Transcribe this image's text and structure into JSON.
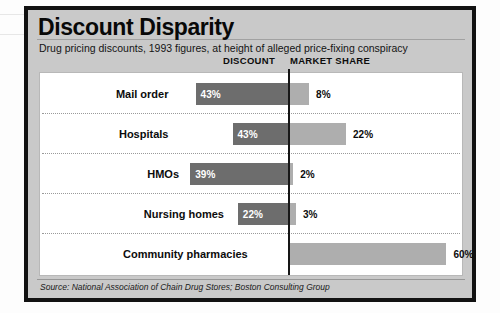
{
  "figure": {
    "title": "Discount Disparity",
    "subtitle": "Drug pricing discounts, 1993 figures, at height of alleged price-fixing conspiracy",
    "source": "Source: National Association of Chain Drug Stores; Boston Consulting Group",
    "column_headers": {
      "discount": "DISCOUNT",
      "market_share": "MARKET SHARE"
    },
    "colors": {
      "discount_bar": "#6d6d6d",
      "market_share_bar": "#aeaeae",
      "plate_background": "#c9c9c9",
      "panel_background": "#ffffff",
      "frame": "#121212",
      "axis": "#171717"
    }
  },
  "chart_data": {
    "type": "bar",
    "title": "Discount Disparity",
    "subtitle": "Drug pricing discounts, 1993 figures, at height of alleged price-fixing conspiracy",
    "orientation": "horizontal",
    "layout": "diverging-bidirectional",
    "categories": [
      "Mail order",
      "Hospitals",
      "HMOs",
      "Nursing homes",
      "Community pharmacies"
    ],
    "series": [
      {
        "name": "DISCOUNT",
        "direction": "left",
        "unit": "%",
        "values": [
          43,
          43,
          39,
          22,
          13
        ],
        "labels": [
          "43%",
          "43%",
          "39%",
          "22%",
          "13%"
        ]
      },
      {
        "name": "MARKET SHARE",
        "direction": "right",
        "unit": "%",
        "values": [
          8,
          22,
          2,
          3,
          60
        ],
        "labels": [
          "8%",
          "22%",
          "2%",
          "3%",
          "60%"
        ]
      }
    ],
    "rows": [
      {
        "category": "Mail order",
        "discount": 43,
        "discount_label": "43%",
        "market_share": 8,
        "market_share_label": "8%"
      },
      {
        "category": "Hospitals",
        "discount": 43,
        "discount_label": "43%",
        "market_share": 22,
        "market_share_label": "22%"
      },
      {
        "category": "HMOs",
        "discount": 39,
        "discount_label": "39%",
        "market_share": 2,
        "market_share_label": "2%"
      },
      {
        "category": "Nursing homes",
        "discount": 22,
        "discount_label": "22%",
        "market_share": 3,
        "market_share_label": "3%"
      },
      {
        "category": "Community pharmacies",
        "discount": 13,
        "discount_label": "13%",
        "market_share": 60,
        "market_share_label": "60%"
      }
    ],
    "xlabel": "",
    "ylabel": "",
    "grid": false,
    "legend": "column-headers-top",
    "source": "Source: National Association of Chain Drug Stores; Boston Consulting Group"
  }
}
